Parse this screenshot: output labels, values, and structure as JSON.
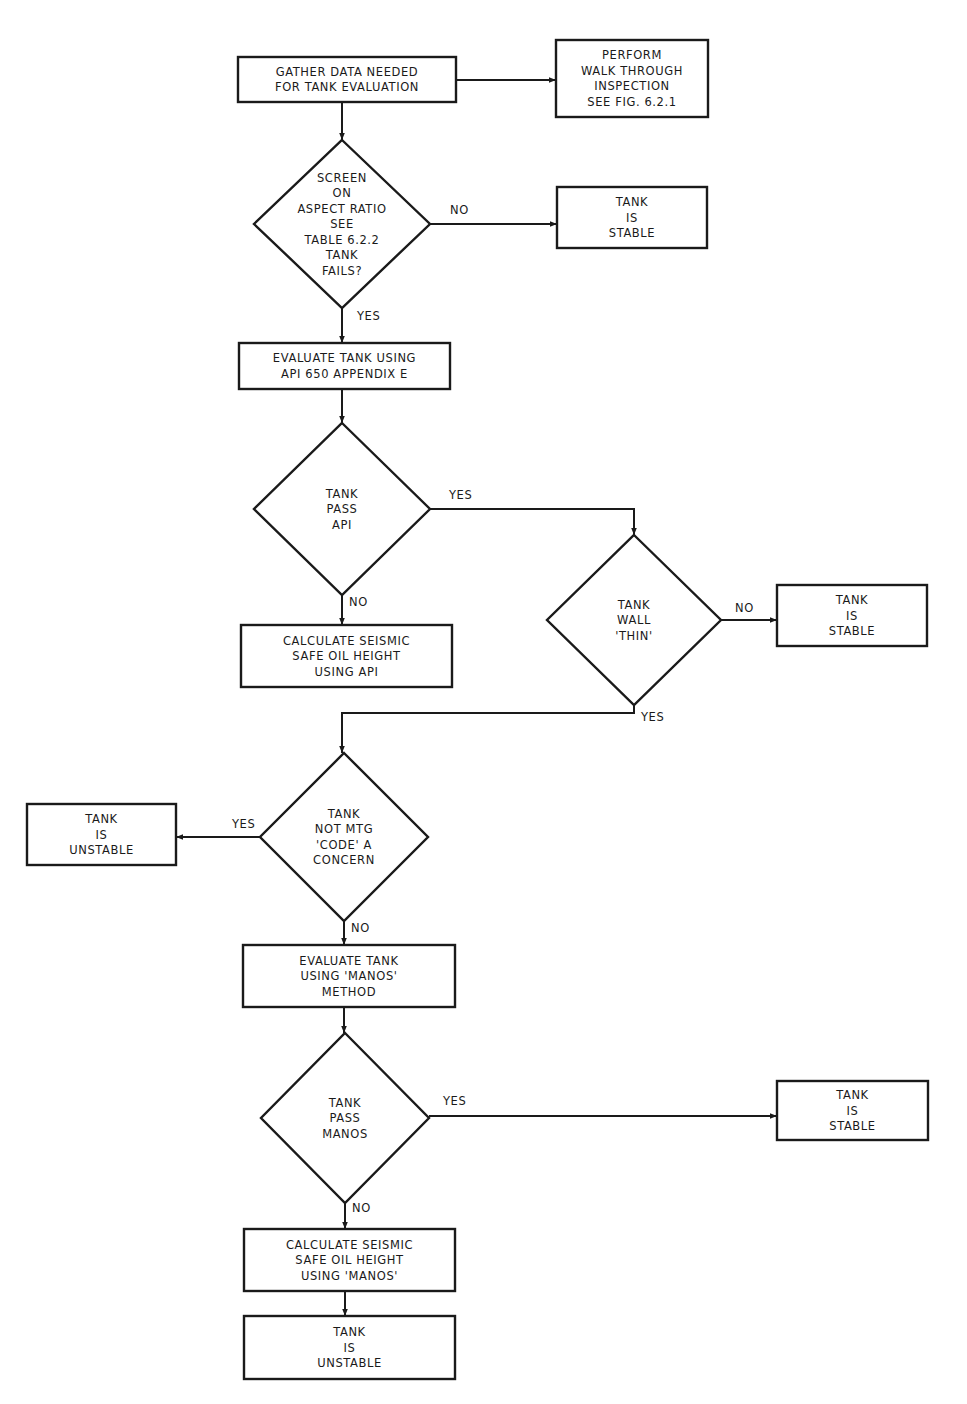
{
  "figure": {
    "type": "flowchart",
    "colors": {
      "ink": "#1a1a1a",
      "paper": "#ffffff"
    }
  },
  "nodes": [
    {
      "id": "gather",
      "shape": "box",
      "lines": [
        "GATHER DATA NEEDED",
        "FOR TANK EVALUATION"
      ]
    },
    {
      "id": "walkthrough",
      "shape": "box",
      "lines": [
        "PERFORM",
        "WALK THROUGH",
        "INSPECTION",
        "SEE FIG. 6.2.1"
      ]
    },
    {
      "id": "screen",
      "shape": "diamond",
      "lines": [
        "SCREEN",
        "ON",
        "ASPECT RATIO",
        "SEE",
        "TABLE 6.2.2",
        "TANK",
        "FAILS?"
      ]
    },
    {
      "id": "stable1",
      "shape": "box",
      "lines": [
        "TANK",
        "IS",
        "STABLE"
      ]
    },
    {
      "id": "eval-api",
      "shape": "box",
      "lines": [
        "EVALUATE TANK USING",
        "API 650 APPENDIX E"
      ]
    },
    {
      "id": "pass-api",
      "shape": "diamond",
      "lines": [
        "TANK",
        "PASS",
        "API"
      ]
    },
    {
      "id": "calc-api",
      "shape": "box",
      "lines": [
        "CALCULATE SEISMIC",
        "SAFE OIL HEIGHT",
        "USING API"
      ]
    },
    {
      "id": "wall-thin",
      "shape": "diamond",
      "lines": [
        "TANK",
        "WALL",
        "'THIN'"
      ]
    },
    {
      "id": "stable2",
      "shape": "box",
      "lines": [
        "TANK",
        "IS",
        "STABLE"
      ]
    },
    {
      "id": "code-concern",
      "shape": "diamond",
      "lines": [
        "TANK",
        "NOT MTG",
        "'CODE' A",
        "CONCERN"
      ]
    },
    {
      "id": "unstable1",
      "shape": "box",
      "lines": [
        "TANK",
        "IS",
        "UNSTABLE"
      ]
    },
    {
      "id": "eval-manos",
      "shape": "box",
      "lines": [
        "EVALUATE TANK",
        "USING 'MANOS'",
        "METHOD"
      ]
    },
    {
      "id": "pass-manos",
      "shape": "diamond",
      "lines": [
        "TANK",
        "PASS",
        "MANOS"
      ]
    },
    {
      "id": "stable3",
      "shape": "box",
      "lines": [
        "TANK",
        "IS",
        "STABLE"
      ]
    },
    {
      "id": "calc-manos",
      "shape": "box",
      "lines": [
        "CALCULATE SEISMIC",
        "SAFE OIL HEIGHT",
        "USING 'MANOS'"
      ]
    },
    {
      "id": "unstable2",
      "shape": "box",
      "lines": [
        "TANK",
        "IS",
        "UNSTABLE"
      ]
    }
  ],
  "edges": [
    {
      "from": "gather",
      "to": "walkthrough",
      "label": ""
    },
    {
      "from": "gather",
      "to": "screen",
      "label": ""
    },
    {
      "from": "screen",
      "to": "stable1",
      "label": "NO"
    },
    {
      "from": "screen",
      "to": "eval-api",
      "label": "YES"
    },
    {
      "from": "eval-api",
      "to": "pass-api",
      "label": ""
    },
    {
      "from": "pass-api",
      "to": "wall-thin",
      "label": "YES"
    },
    {
      "from": "pass-api",
      "to": "calc-api",
      "label": "NO"
    },
    {
      "from": "wall-thin",
      "to": "stable2",
      "label": "NO"
    },
    {
      "from": "wall-thin",
      "to": "code-concern",
      "label": "YES"
    },
    {
      "from": "code-concern",
      "to": "unstable1",
      "label": "YES"
    },
    {
      "from": "code-concern",
      "to": "eval-manos",
      "label": "NO"
    },
    {
      "from": "eval-manos",
      "to": "pass-manos",
      "label": ""
    },
    {
      "from": "pass-manos",
      "to": "stable3",
      "label": "YES"
    },
    {
      "from": "pass-manos",
      "to": "calc-manos",
      "label": "NO"
    },
    {
      "from": "calc-manos",
      "to": "unstable2",
      "label": ""
    }
  ]
}
